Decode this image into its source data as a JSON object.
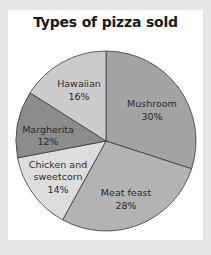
{
  "chart_data": {
    "type": "pie",
    "title": "Types of pizza sold",
    "start_angle_deg": 0,
    "direction": "clockwise",
    "slices": [
      {
        "label": "Mushroom",
        "value": 30,
        "display": "30%",
        "color": "#a3a3a3"
      },
      {
        "label": "Meat feast",
        "value": 28,
        "display": "28%",
        "color": "#b3b3b3"
      },
      {
        "label": "Chicken and sweetcorn",
        "value": 14,
        "display": "14%",
        "color": "#dddddd"
      },
      {
        "label": "Margherita",
        "value": 12,
        "display": "12%",
        "color": "#8c8c8c"
      },
      {
        "label": "Hawaiian",
        "value": 16,
        "display": "16%",
        "color": "#cbcbcb"
      }
    ],
    "legend": "none"
  },
  "labels": {
    "mushroom": [
      "Mushroom",
      "30%"
    ],
    "meat_feast": [
      "Meat feast",
      "28%"
    ],
    "chicken": [
      "Chicken and",
      "sweetcorn",
      "14%"
    ],
    "margherita": [
      "Margherita",
      "12%"
    ],
    "hawaiian": [
      "Hawaiian",
      "16%"
    ]
  }
}
